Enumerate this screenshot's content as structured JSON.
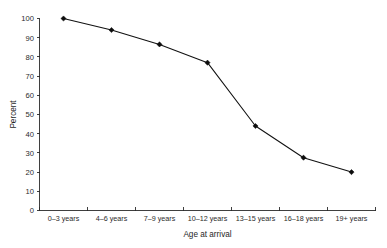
{
  "chart_data": {
    "type": "line",
    "title": "",
    "subtitle": "",
    "xlabel": "Age at arrival",
    "ylabel": "Percent",
    "categories": [
      "0–3 years",
      "4–6 years",
      "7–9 years",
      "10–12 years",
      "13–15 years",
      "16–18 years",
      "19+ years"
    ],
    "values": [
      100,
      94,
      86.5,
      77,
      44,
      27.5,
      20
    ],
    "series": [
      {
        "name": "Percent",
        "values": [
          100,
          94,
          86.5,
          77,
          44,
          27.5,
          20
        ]
      }
    ],
    "ylim": [
      0,
      100
    ],
    "yticks": [
      0,
      10,
      20,
      30,
      40,
      50,
      60,
      70,
      80,
      90,
      100
    ],
    "ytick_labels": [
      "0",
      "10",
      "20",
      "30",
      "40",
      "50",
      "60",
      "70",
      "80",
      "90",
      "100"
    ],
    "grid": false,
    "legend": false,
    "legend_position": "none",
    "marker": "diamond",
    "line_color": "#111111",
    "marker_color": "#0d0d0d",
    "axis_color": "#2a2a2a",
    "background_color": "#ffffff"
  }
}
